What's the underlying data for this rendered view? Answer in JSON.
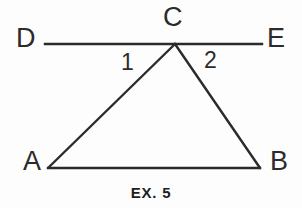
{
  "figure": {
    "caption": "EX. 5",
    "background_color": "#fdfdfd",
    "stroke_color": "#2b2b2b",
    "text_color": "#2b2b2b",
    "stroke_width": 2,
    "vertex_labels": {
      "D": "D",
      "E": "E",
      "C": "C",
      "A": "A",
      "B": "B"
    },
    "angle_labels": {
      "one": "1",
      "two": "2"
    },
    "geometry": {
      "points": {
        "D": [
          45,
          44
        ],
        "E": [
          262,
          44
        ],
        "C": [
          175,
          44
        ],
        "A": [
          48,
          168
        ],
        "B": [
          260,
          168
        ]
      },
      "segments": [
        {
          "name": "line-DE",
          "from": "D",
          "to": "E"
        },
        {
          "name": "side-AC",
          "from": "A",
          "to": "C"
        },
        {
          "name": "side-CB",
          "from": "C",
          "to": "B"
        },
        {
          "name": "side-AB",
          "from": "A",
          "to": "B"
        }
      ]
    }
  }
}
